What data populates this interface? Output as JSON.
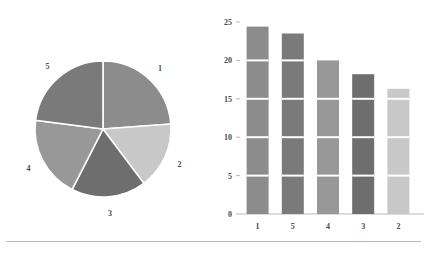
{
  "chart_data": [
    {
      "type": "pie",
      "title": "",
      "categories": [
        "1",
        "2",
        "3",
        "4",
        "5"
      ],
      "values": [
        24.4,
        16.3,
        18.2,
        20.0,
        23.5
      ],
      "labels": [
        "1",
        "2",
        "3",
        "4",
        "5"
      ],
      "colors": [
        "#8c8c8c",
        "#c8c8c8",
        "#6e6e6e",
        "#989898",
        "#7a7a7a"
      ],
      "start_angle_deg": 0,
      "direction": "clockwise",
      "legend": "none",
      "label_position": "outside",
      "wedge_edge_color": "#ffffff"
    },
    {
      "type": "bar",
      "subtype": "stacked-segments",
      "title": "",
      "xlabel": "",
      "ylabel": "",
      "categories": [
        "1",
        "5",
        "4",
        "3",
        "2"
      ],
      "values": [
        24.4,
        23.5,
        20.0,
        18.2,
        16.3
      ],
      "colors": [
        "#8c8c8c",
        "#7a7a7a",
        "#989898",
        "#6e6e6e",
        "#c8c8c8"
      ],
      "ylim": [
        0,
        25
      ],
      "yticks": [
        0,
        5,
        10,
        15,
        20,
        25
      ],
      "ytick_labels": [
        "0",
        "5",
        "10",
        "15",
        "20",
        "25"
      ],
      "xtick_labels": [
        "1",
        "5",
        "4",
        "3",
        "2"
      ],
      "segment_step": 5,
      "segment_divider_color": "#ffffff",
      "grid": false,
      "legend": "none",
      "axis_color": "#b9b9b9"
    }
  ],
  "footer": {
    "rule_color": "#b9b9b9"
  }
}
